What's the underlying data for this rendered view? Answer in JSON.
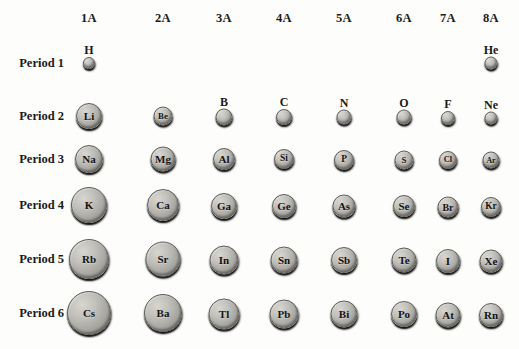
{
  "columns": [
    {
      "label": "1A",
      "x": 89
    },
    {
      "label": "2A",
      "x": 163
    },
    {
      "label": "3A",
      "x": 224
    },
    {
      "label": "4A",
      "x": 284
    },
    {
      "label": "5A",
      "x": 344
    },
    {
      "label": "6A",
      "x": 404
    },
    {
      "label": "7A",
      "x": 448
    },
    {
      "label": "8A",
      "x": 491
    }
  ],
  "column_header_y": 18,
  "rows": [
    {
      "label": "Period 1",
      "y": 63,
      "label_x": 64
    },
    {
      "label": "Period 2",
      "y": 116,
      "label_x": 64
    },
    {
      "label": "Period 3",
      "y": 159,
      "label_x": 64
    },
    {
      "label": "Period 4",
      "y": 205,
      "label_x": 64
    },
    {
      "label": "Period 5",
      "y": 259,
      "label_x": 64
    },
    {
      "label": "Period 6",
      "y": 313,
      "label_x": 64
    }
  ],
  "chart_data": {
    "type": "scatter",
    "xlabel": "Group",
    "ylabel": "Period",
    "categories": [
      "1A",
      "2A",
      "3A",
      "4A",
      "5A",
      "6A",
      "7A",
      "8A"
    ],
    "row_categories": [
      "Period 1",
      "Period 2",
      "Period 3",
      "Period 4",
      "Period 5",
      "Period 6"
    ],
    "encoding": "circle diameter in pixels represents relative atomic radius",
    "grid": false,
    "legend": "none",
    "points": [
      {
        "symbol": "H",
        "group": "1A",
        "period": "Period 1",
        "cx": 89,
        "cy": 63,
        "d": 10,
        "label_position": "above"
      },
      {
        "symbol": "He",
        "group": "8A",
        "period": "Period 1",
        "cx": 491,
        "cy": 63,
        "d": 11,
        "label_position": "above"
      },
      {
        "symbol": "Li",
        "group": "1A",
        "period": "Period 2",
        "cx": 89,
        "cy": 116,
        "d": 24,
        "label_position": "inside"
      },
      {
        "symbol": "Be",
        "group": "2A",
        "period": "Period 2",
        "cx": 163,
        "cy": 116,
        "d": 17,
        "label_position": "inside"
      },
      {
        "symbol": "B",
        "group": "3A",
        "period": "Period 2",
        "cx": 224,
        "cy": 117,
        "d": 15,
        "label_position": "above"
      },
      {
        "symbol": "C",
        "group": "4A",
        "period": "Period 2",
        "cx": 284,
        "cy": 117,
        "d": 14,
        "label_position": "above"
      },
      {
        "symbol": "N",
        "group": "5A",
        "period": "Period 2",
        "cx": 344,
        "cy": 117,
        "d": 13,
        "label_position": "above"
      },
      {
        "symbol": "O",
        "group": "6A",
        "period": "Period 2",
        "cx": 404,
        "cy": 117,
        "d": 13,
        "label_position": "above"
      },
      {
        "symbol": "F",
        "group": "7A",
        "period": "Period 2",
        "cx": 448,
        "cy": 118,
        "d": 12,
        "label_position": "above"
      },
      {
        "symbol": "Ne",
        "group": "8A",
        "period": "Period 2",
        "cx": 491,
        "cy": 118,
        "d": 11,
        "label_position": "above"
      },
      {
        "symbol": "Na",
        "group": "1A",
        "period": "Period 3",
        "cx": 89,
        "cy": 159,
        "d": 26,
        "label_position": "inside"
      },
      {
        "symbol": "Mg",
        "group": "2A",
        "period": "Period 3",
        "cx": 163,
        "cy": 159,
        "d": 23,
        "label_position": "inside"
      },
      {
        "symbol": "Al",
        "group": "3A",
        "period": "Period 3",
        "cx": 224,
        "cy": 159,
        "d": 20,
        "label_position": "inside"
      },
      {
        "symbol": "Si",
        "group": "4A",
        "period": "Period 3",
        "cx": 284,
        "cy": 159,
        "d": 18,
        "label_position": "inside"
      },
      {
        "symbol": "P",
        "group": "5A",
        "period": "Period 3",
        "cx": 344,
        "cy": 160,
        "d": 18,
        "label_position": "inside"
      },
      {
        "symbol": "S",
        "group": "6A",
        "period": "Period 3",
        "cx": 404,
        "cy": 160,
        "d": 17,
        "label_position": "inside"
      },
      {
        "symbol": "Cl",
        "group": "7A",
        "period": "Period 3",
        "cx": 448,
        "cy": 160,
        "d": 16,
        "label_position": "inside"
      },
      {
        "symbol": "Ar",
        "group": "8A",
        "period": "Period 3",
        "cx": 491,
        "cy": 160,
        "d": 15,
        "label_position": "inside"
      },
      {
        "symbol": "K",
        "group": "1A",
        "period": "Period 4",
        "cx": 89,
        "cy": 205,
        "d": 34,
        "label_position": "inside"
      },
      {
        "symbol": "Ca",
        "group": "2A",
        "period": "Period 4",
        "cx": 163,
        "cy": 205,
        "d": 30,
        "label_position": "inside"
      },
      {
        "symbol": "Ga",
        "group": "3A",
        "period": "Period 4",
        "cx": 224,
        "cy": 206,
        "d": 24,
        "label_position": "inside"
      },
      {
        "symbol": "Ge",
        "group": "4A",
        "period": "Period 4",
        "cx": 284,
        "cy": 206,
        "d": 22,
        "label_position": "inside"
      },
      {
        "symbol": "As",
        "group": "5A",
        "period": "Period 4",
        "cx": 344,
        "cy": 206,
        "d": 21,
        "label_position": "inside"
      },
      {
        "symbol": "Se",
        "group": "6A",
        "period": "Period 4",
        "cx": 404,
        "cy": 206,
        "d": 20,
        "label_position": "inside"
      },
      {
        "symbol": "Br",
        "group": "7A",
        "period": "Period 4",
        "cx": 448,
        "cy": 207,
        "d": 19,
        "label_position": "inside"
      },
      {
        "symbol": "Kr",
        "group": "8A",
        "period": "Period 4",
        "cx": 491,
        "cy": 207,
        "d": 18,
        "label_position": "inside"
      },
      {
        "symbol": "Rb",
        "group": "1A",
        "period": "Period 5",
        "cx": 89,
        "cy": 259,
        "d": 38,
        "label_position": "inside"
      },
      {
        "symbol": "Sr",
        "group": "2A",
        "period": "Period 5",
        "cx": 163,
        "cy": 259,
        "d": 33,
        "label_position": "inside"
      },
      {
        "symbol": "In",
        "group": "3A",
        "period": "Period 5",
        "cx": 224,
        "cy": 260,
        "d": 27,
        "label_position": "inside"
      },
      {
        "symbol": "Sn",
        "group": "4A",
        "period": "Period 5",
        "cx": 284,
        "cy": 260,
        "d": 25,
        "label_position": "inside"
      },
      {
        "symbol": "Sb",
        "group": "5A",
        "period": "Period 5",
        "cx": 344,
        "cy": 260,
        "d": 24,
        "label_position": "inside"
      },
      {
        "symbol": "Te",
        "group": "6A",
        "period": "Period 5",
        "cx": 404,
        "cy": 260,
        "d": 23,
        "label_position": "inside"
      },
      {
        "symbol": "I",
        "group": "7A",
        "period": "Period 5",
        "cx": 448,
        "cy": 261,
        "d": 22,
        "label_position": "inside"
      },
      {
        "symbol": "Xe",
        "group": "8A",
        "period": "Period 5",
        "cx": 491,
        "cy": 261,
        "d": 21,
        "label_position": "inside"
      },
      {
        "symbol": "Cs",
        "group": "1A",
        "period": "Period 6",
        "cx": 89,
        "cy": 313,
        "d": 42,
        "label_position": "inside"
      },
      {
        "symbol": "Ba",
        "group": "2A",
        "period": "Period 6",
        "cx": 163,
        "cy": 313,
        "d": 36,
        "label_position": "inside"
      },
      {
        "symbol": "Tl",
        "group": "3A",
        "period": "Period 6",
        "cx": 224,
        "cy": 314,
        "d": 29,
        "label_position": "inside"
      },
      {
        "symbol": "Pb",
        "group": "4A",
        "period": "Period 6",
        "cx": 284,
        "cy": 314,
        "d": 27,
        "label_position": "inside"
      },
      {
        "symbol": "Bi",
        "group": "5A",
        "period": "Period 6",
        "cx": 344,
        "cy": 314,
        "d": 25,
        "label_position": "inside"
      },
      {
        "symbol": "Po",
        "group": "6A",
        "period": "Period 6",
        "cx": 404,
        "cy": 314,
        "d": 24,
        "label_position": "inside"
      },
      {
        "symbol": "At",
        "group": "7A",
        "period": "Period 6",
        "cx": 448,
        "cy": 315,
        "d": 23,
        "label_position": "inside"
      },
      {
        "symbol": "Rn",
        "group": "8A",
        "period": "Period 6",
        "cx": 491,
        "cy": 315,
        "d": 22,
        "label_position": "inside"
      }
    ]
  }
}
